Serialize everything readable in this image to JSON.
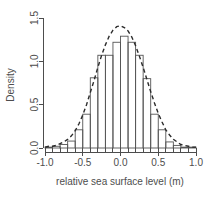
{
  "chart_data": {
    "type": "bar",
    "title": "",
    "xlabel": "relative sea surface level (m)",
    "ylabel": "Density",
    "xlim": [
      -1.0,
      1.0
    ],
    "ylim": [
      0.0,
      1.5
    ],
    "xticks": [
      -1.0,
      -0.5,
      0.0,
      0.5,
      1.0
    ],
    "xtick_labels": [
      "-1.0",
      "-0.5",
      "0.0",
      "0.5",
      "1.0"
    ],
    "yticks": [
      0.0,
      0.5,
      1.0,
      1.5
    ],
    "ytick_labels": [
      "0.0",
      "0.5",
      "1.0",
      "1.5"
    ],
    "grid": false,
    "legend": false,
    "bin_width": 0.1,
    "bin_edges": [
      -1.0,
      -0.9,
      -0.8,
      -0.7,
      -0.6,
      -0.5,
      -0.4,
      -0.3,
      -0.2,
      -0.1,
      0.0,
      0.1,
      0.2,
      0.3,
      0.4,
      0.5,
      0.6,
      0.7,
      0.8,
      0.9,
      1.0
    ],
    "categories": [
      "-0.95",
      "-0.85",
      "-0.75",
      "-0.65",
      "-0.55",
      "-0.45",
      "-0.35",
      "-0.25",
      "-0.15",
      "-0.05",
      "0.05",
      "0.15",
      "0.25",
      "0.35",
      "0.45",
      "0.55",
      "0.65",
      "0.75",
      "0.85",
      "0.95"
    ],
    "values": [
      0.01,
      0.02,
      0.04,
      0.08,
      0.21,
      0.39,
      0.81,
      1.07,
      1.07,
      1.22,
      1.29,
      1.22,
      1.07,
      0.8,
      0.39,
      0.21,
      0.07,
      0.03,
      0.01,
      0.01
    ],
    "series": [
      {
        "name": "Histogram (density)",
        "type": "bar",
        "values": [
          0.01,
          0.02,
          0.04,
          0.08,
          0.21,
          0.39,
          0.81,
          1.07,
          1.07,
          1.22,
          1.29,
          1.22,
          1.07,
          0.8,
          0.39,
          0.21,
          0.07,
          0.03,
          0.01,
          0.01
        ]
      },
      {
        "name": "Density estimate",
        "type": "line",
        "style": "dashed",
        "x": [
          -1.0,
          -0.95,
          -0.9,
          -0.85,
          -0.8,
          -0.75,
          -0.7,
          -0.65,
          -0.6,
          -0.55,
          -0.5,
          -0.45,
          -0.4,
          -0.35,
          -0.3,
          -0.25,
          -0.2,
          -0.15,
          -0.1,
          -0.05,
          0.0,
          0.05,
          0.1,
          0.15,
          0.2,
          0.25,
          0.3,
          0.35,
          0.4,
          0.45,
          0.5,
          0.55,
          0.6,
          0.65,
          0.7,
          0.75,
          0.8,
          0.85,
          0.9,
          0.95,
          1.0
        ],
        "y": [
          0.01,
          0.02,
          0.02,
          0.03,
          0.05,
          0.07,
          0.1,
          0.14,
          0.2,
          0.28,
          0.38,
          0.5,
          0.64,
          0.78,
          0.93,
          1.07,
          1.19,
          1.29,
          1.36,
          1.4,
          1.41,
          1.39,
          1.35,
          1.28,
          1.18,
          1.06,
          0.93,
          0.79,
          0.65,
          0.52,
          0.4,
          0.3,
          0.21,
          0.15,
          0.1,
          0.07,
          0.04,
          0.03,
          0.02,
          0.01,
          0.01
        ]
      }
    ]
  }
}
